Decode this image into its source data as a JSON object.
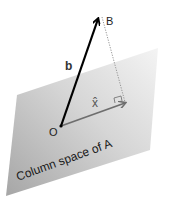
{
  "diagram": {
    "plane_label": "Column space of A",
    "vector_b_label": "b",
    "vector_xhat_label": "x̂",
    "point_origin_label": "O",
    "point_B_label": "B",
    "colors": {
      "plane_light": "#f2f2f2",
      "plane_dark": "#a8a8a8",
      "vector_b": "#000000",
      "vector_xhat": "#6e6e6e",
      "dotted_line": "#888888",
      "text": "#222222"
    }
  }
}
